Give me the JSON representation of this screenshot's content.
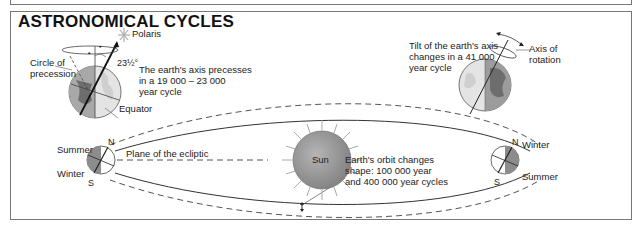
{
  "title": "ASTRONOMICAL CYCLES",
  "precession": {
    "star_label": "Polaris",
    "circle_label_line1": "Circle of",
    "circle_label_line2": "precession",
    "angle_label": "23½°",
    "description_line1": "The earth's axis precesses",
    "description_line2": "in a 19 000 – 23 000",
    "description_line3": "year cycle",
    "equator_label": "Equator"
  },
  "obliquity": {
    "description_line1": "Tilt of the earth's axis",
    "description_line2": "changes in a 41 000",
    "description_line3": "year cycle",
    "axis_label_line1": "Axis of",
    "axis_label_line2": "rotation"
  },
  "orbit": {
    "left_summer": "Summer",
    "left_winter": "Winter",
    "left_north": "N",
    "left_south": "S",
    "ecliptic_label": "Plane of the ecliptic",
    "sun_label": "Sun",
    "eccentricity_line1": "Earth's orbit changes",
    "eccentricity_line2": "shape: 100 000 year",
    "eccentricity_line3": "and 400 000 year cycles",
    "right_winter": "Winter",
    "right_summer": "Summer",
    "right_north": "N",
    "right_south": "S"
  },
  "colors": {
    "frame": "#777777",
    "sun_fill": "#9a9a9a",
    "globe_dark": "#8c8c8c",
    "globe_light": "#e4e4e4",
    "ink": "#222222"
  }
}
